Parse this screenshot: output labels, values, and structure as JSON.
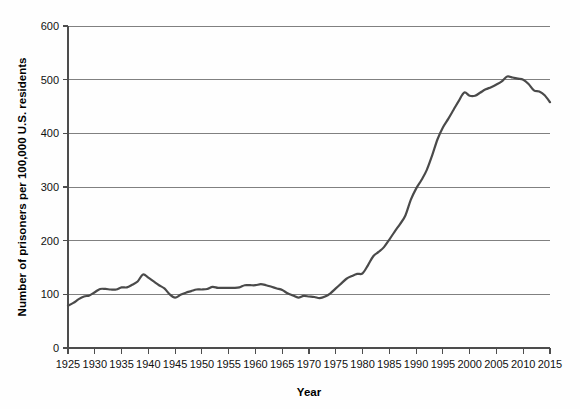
{
  "chart_data": {
    "type": "line",
    "title": "",
    "xlabel": "Year",
    "ylabel": "Number of prisoners per 100,000 U.S. residents",
    "xlim": [
      1925,
      2015
    ],
    "ylim": [
      0,
      600
    ],
    "grid": "horizontal",
    "legend": "none",
    "x_ticks": [
      1925,
      1930,
      1935,
      1940,
      1945,
      1950,
      1955,
      1960,
      1965,
      1970,
      1975,
      1980,
      1985,
      1990,
      1995,
      2000,
      2005,
      2010,
      2015
    ],
    "y_ticks": [
      0,
      100,
      200,
      300,
      400,
      500,
      600
    ],
    "line_color": "#4a4a4a",
    "series": [
      {
        "name": "Incarceration rate",
        "x": [
          1925,
          1926,
          1927,
          1928,
          1929,
          1930,
          1931,
          1932,
          1933,
          1934,
          1935,
          1936,
          1937,
          1938,
          1939,
          1940,
          1941,
          1942,
          1943,
          1944,
          1945,
          1946,
          1947,
          1948,
          1949,
          1950,
          1951,
          1952,
          1953,
          1954,
          1955,
          1956,
          1957,
          1958,
          1959,
          1960,
          1961,
          1962,
          1963,
          1964,
          1965,
          1966,
          1967,
          1968,
          1969,
          1970,
          1971,
          1972,
          1973,
          1974,
          1975,
          1976,
          1977,
          1978,
          1979,
          1980,
          1981,
          1982,
          1983,
          1984,
          1985,
          1986,
          1987,
          1988,
          1989,
          1990,
          1991,
          1992,
          1993,
          1994,
          1995,
          1996,
          1997,
          1998,
          1999,
          2000,
          2001,
          2002,
          2003,
          2004,
          2005,
          2006,
          2007,
          2008,
          2009,
          2010,
          2011,
          2012,
          2013,
          2014,
          2015
        ],
        "values": [
          79,
          84,
          91,
          96,
          98,
          104,
          110,
          110,
          109,
          109,
          113,
          113,
          118,
          124,
          137,
          131,
          124,
          117,
          111,
          100,
          94,
          99,
          103,
          106,
          109,
          109,
          110,
          114,
          112,
          112,
          112,
          112,
          113,
          117,
          117,
          117,
          119,
          117,
          114,
          111,
          108,
          102,
          98,
          94,
          97,
          96,
          95,
          93,
          96,
          102,
          111,
          120,
          129,
          134,
          138,
          139,
          154,
          171,
          179,
          188,
          202,
          217,
          231,
          247,
          276,
          297,
          313,
          332,
          359,
          389,
          411,
          427,
          444,
          461,
          476,
          470,
          470,
          476,
          482,
          486,
          491,
          497,
          506,
          504,
          502,
          500,
          492,
          480,
          478,
          471,
          458
        ]
      }
    ]
  },
  "axis": {
    "y_title": "Number of prisoners per 100,000 U.S. residents",
    "x_title": "Year"
  }
}
